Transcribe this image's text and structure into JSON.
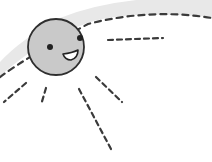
{
  "illustration": {
    "subject": "smiling sun",
    "icon": "sun-face-icon",
    "colors": {
      "background": "#ffffff",
      "sun_fill": "#c8c8c8",
      "outline": "#333333",
      "band": "#e6e6e6",
      "dash": "#3a3a3a"
    },
    "sun": {
      "cx": 56,
      "cy": 47,
      "r": 28
    },
    "rays": [
      {
        "name": "ray-right",
        "x1": 108,
        "y1": 40,
        "x2": 163,
        "y2": 38
      },
      {
        "name": "ray-down-right",
        "x1": 95,
        "y1": 77,
        "x2": 122,
        "y2": 103
      },
      {
        "name": "ray-down",
        "x1": 79,
        "y1": 89,
        "x2": 111,
        "y2": 149
      },
      {
        "name": "ray-down-left",
        "x1": 46,
        "y1": 88,
        "x2": 41,
        "y2": 105
      },
      {
        "name": "ray-left-lower",
        "x1": 26,
        "y1": 83,
        "x2": 4,
        "y2": 102
      },
      {
        "name": "ray-left-upper",
        "x1": 23,
        "y1": 63,
        "x2": 0,
        "y2": 77
      }
    ]
  }
}
